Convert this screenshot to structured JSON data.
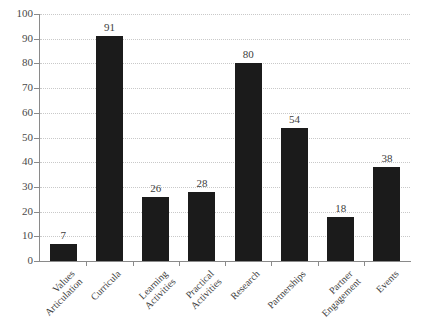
{
  "chart_data": {
    "type": "bar",
    "title": "",
    "subtitle": "",
    "xlabel": "",
    "ylabel": "",
    "ylim": [
      0,
      100
    ],
    "ytick_step": 10,
    "grid": true,
    "grid_axis": "y",
    "legend": false,
    "bar_color": "#1b1b1b",
    "categories": [
      "Values Articulation",
      "Curricula",
      "Learning Activities",
      "Practical Activities",
      "Research",
      "Partnerships",
      "Partner Engagement",
      "Events"
    ],
    "category_lines": [
      [
        "Values",
        "Articulation"
      ],
      [
        "Curricula"
      ],
      [
        "Learning",
        "Activities"
      ],
      [
        "Practical",
        "Activities"
      ],
      [
        "Research"
      ],
      [
        "Partnerships"
      ],
      [
        "Partner",
        "Engagement"
      ],
      [
        "Events"
      ]
    ],
    "values": [
      7,
      91,
      26,
      28,
      80,
      54,
      18,
      38
    ],
    "yticks": [
      0,
      10,
      20,
      30,
      40,
      50,
      60,
      70,
      80,
      90,
      100
    ],
    "ytick_labels": [
      "0",
      "10",
      "20",
      "30",
      "40",
      "50",
      "60",
      "70",
      "80",
      "90",
      "100"
    ],
    "data_labels": [
      "7",
      "91",
      "26",
      "28",
      "80",
      "54",
      "18",
      "38"
    ]
  }
}
